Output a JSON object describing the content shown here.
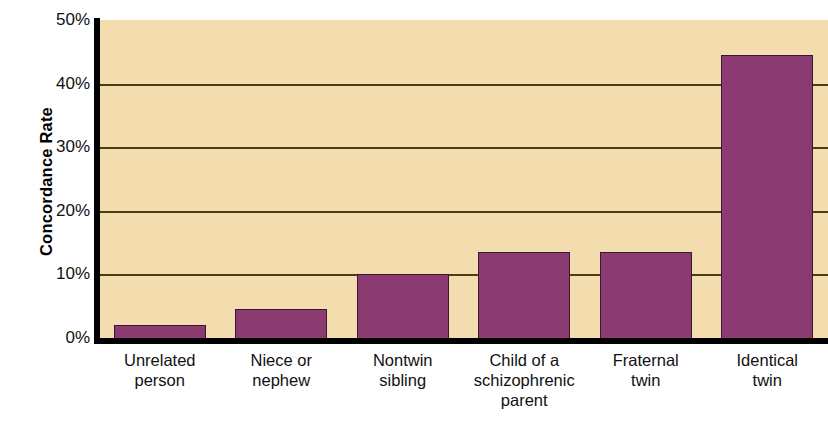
{
  "chart_data": {
    "type": "bar",
    "title": "",
    "xlabel": "",
    "ylabel": "Concordance Rate",
    "ylim": [
      0,
      50
    ],
    "grid": true,
    "legend": "none",
    "y_ticks": [
      "0%",
      "10%",
      "20%",
      "30%",
      "40%",
      "50%"
    ],
    "y_tick_values": [
      0,
      10,
      20,
      30,
      40,
      50
    ],
    "categories": [
      "Unrelated\nperson",
      "Niece or\nnephew",
      "Nontwin\nsibling",
      "Child of a\nschizophrenic\nparent",
      "Fraternal\ntwin",
      "Identical\ntwin"
    ],
    "category_lines": [
      [
        "Unrelated",
        "person"
      ],
      [
        "Niece or",
        "nephew"
      ],
      [
        "Nontwin",
        "sibling"
      ],
      [
        "Child of a",
        "schizophrenic",
        "parent"
      ],
      [
        "Fraternal",
        "twin"
      ],
      [
        "Identical",
        "twin"
      ]
    ],
    "values": [
      2,
      4.5,
      10,
      13.6,
      13.6,
      44.5
    ],
    "bar_color": "#8b3a72",
    "bar_edge_color": "#3a1730",
    "plot_background": "#f3dcae",
    "axis_color": "#000000",
    "gridline_color": "#4a3d16"
  }
}
